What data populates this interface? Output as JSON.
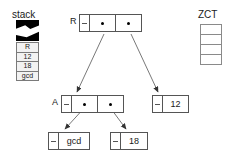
{
  "diagram": {
    "stack": {
      "label": "stack",
      "cells": [
        "R",
        "12",
        "18",
        "gcd"
      ]
    },
    "zct": {
      "label": "ZCT",
      "rows": [
        "",
        "",
        "",
        ""
      ]
    },
    "nodes": [
      {
        "id": "R",
        "label": "R",
        "slots": [
          "pointer",
          "pointer"
        ]
      },
      {
        "id": "A",
        "label": "A",
        "slots": [
          "pointer",
          "pointer"
        ]
      },
      {
        "id": "12",
        "label": "",
        "value": "12"
      },
      {
        "id": "gcd",
        "label": "",
        "value": "gcd"
      },
      {
        "id": "18",
        "label": "",
        "value": "18"
      }
    ],
    "values": {
      "twelve": "12",
      "gcd": "gcd",
      "eighteen": "18"
    },
    "edges": [
      {
        "from": "R.car",
        "to": "A"
      },
      {
        "from": "R.cdr",
        "to": "12"
      },
      {
        "from": "A.car",
        "to": "gcd"
      },
      {
        "from": "A.cdr",
        "to": "18"
      }
    ],
    "colors": {
      "line": "#555555",
      "stack_fill": "#f2f2f2",
      "stack_border": "#7a7a7a",
      "torn": "#000000",
      "text": "#1a1a1a"
    }
  }
}
